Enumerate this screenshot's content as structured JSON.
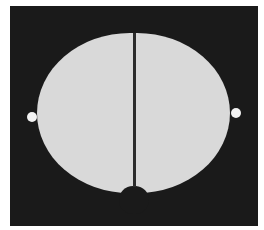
{
  "figure": {
    "colors": {
      "page": "#ffffff",
      "background": "#1a1a1a",
      "cell_fill": "#d9d9d9",
      "divider": "#2b2b2b",
      "pole_dot": "#f2f2f2"
    },
    "frame": {
      "x": 10,
      "y": 6,
      "width": 248,
      "height": 220
    },
    "left_half": {
      "x_min": 37,
      "x_max": 133,
      "y_top": 34,
      "y_bottom": 193
    },
    "right_half": {
      "x_min": 136,
      "x_max": 230,
      "y_top": 33,
      "y_bottom": 193
    },
    "divider": {
      "x": 134.5,
      "y_top": 33,
      "y_bottom": 186,
      "width": 3
    },
    "poles": [
      {
        "name": "left-pole",
        "cx": 32,
        "cy": 117,
        "r": 5
      },
      {
        "name": "right-pole",
        "cx": 236,
        "cy": 113,
        "r": 5
      }
    ]
  }
}
